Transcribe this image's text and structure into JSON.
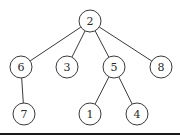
{
  "diagram": {
    "type": "tree",
    "colors": {
      "stroke": "#3a3a3a",
      "label": "#2a2a2a",
      "background": "#ffffff"
    },
    "root": "2",
    "nodes": [
      {
        "id": "2",
        "label": "2",
        "level": 0
      },
      {
        "id": "6",
        "label": "6",
        "level": 1
      },
      {
        "id": "3",
        "label": "3",
        "level": 1
      },
      {
        "id": "5",
        "label": "5",
        "level": 1
      },
      {
        "id": "8",
        "label": "8",
        "level": 1
      },
      {
        "id": "7",
        "label": "7",
        "level": 2
      },
      {
        "id": "1",
        "label": "1",
        "level": 2
      },
      {
        "id": "4",
        "label": "4",
        "level": 2
      }
    ],
    "edges": [
      {
        "from": "2",
        "to": "6"
      },
      {
        "from": "2",
        "to": "3"
      },
      {
        "from": "2",
        "to": "5"
      },
      {
        "from": "2",
        "to": "8"
      },
      {
        "from": "6",
        "to": "7"
      },
      {
        "from": "5",
        "to": "1"
      },
      {
        "from": "5",
        "to": "4"
      }
    ]
  }
}
